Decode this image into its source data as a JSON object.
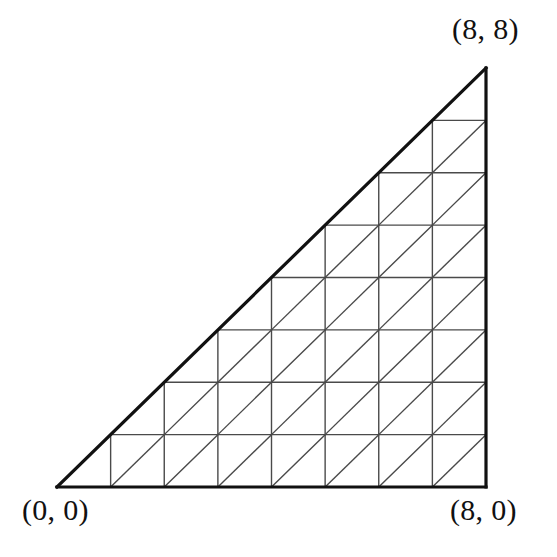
{
  "figure": {
    "background_color": "#ffffff",
    "border_color": "#111111",
    "grid_color": "#4a4a4a",
    "border_width_px": 3.2,
    "grid_width_px": 1.4,
    "diagonal_width_px": 1.4
  },
  "labels": {
    "origin": "(0, 0)",
    "bottom_right": "(8, 0)",
    "top_right": "(8, 8)"
  },
  "chart_data": {
    "type": "scatter",
    "title": "",
    "xlabel": "",
    "ylabel": "",
    "xlim": [
      0,
      8
    ],
    "ylim": [
      0,
      8
    ],
    "grid": true,
    "legend": null,
    "annotations": [
      {
        "text": "(0, 0)",
        "x": 0,
        "y": 0,
        "position": "below-left"
      },
      {
        "text": "(8, 0)",
        "x": 8,
        "y": 0,
        "position": "below-right"
      },
      {
        "text": "(8, 8)",
        "x": 8,
        "y": 8,
        "position": "above-right"
      }
    ],
    "shape": {
      "kind": "right-triangle",
      "vertices": [
        [
          0,
          0
        ],
        [
          8,
          0
        ],
        [
          8,
          8
        ]
      ],
      "legs": [
        "bottom from (0,0) to (8,0)",
        "right from (8,0) to (8,8)"
      ],
      "hypotenuse": "from (0,0) to (8,8)",
      "unit_cells": 8,
      "total_unit_squares": 28,
      "total_half_cells_on_hypotenuse": 8,
      "total_small_triangles": 64
    },
    "pixel_geometry": {
      "origin_px": [
        57,
        487
      ],
      "bottom_right_px": [
        486,
        487
      ],
      "top_right_px": [
        486,
        68
      ],
      "cell_width_px": 53.625,
      "cell_height_px": 52.375
    }
  },
  "geometry_params": {
    "n": 8,
    "x0": 57,
    "y0": 487,
    "x1": 486,
    "y1": 68
  }
}
